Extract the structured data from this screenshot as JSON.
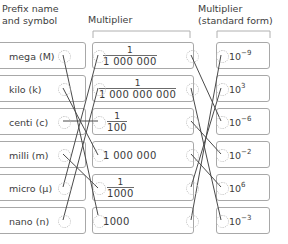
{
  "headers": {
    "prefix": "Prefix name\nand symbol",
    "multiplier": "Multiplier",
    "standard": "Multiplier\n(standard form)"
  },
  "columns": {
    "prefixes": [
      {
        "label": "mega (M)"
      },
      {
        "label": "kilo (k)"
      },
      {
        "label": "centi (c)"
      },
      {
        "label": "milli (m)"
      },
      {
        "label": "micro (µ)"
      },
      {
        "label": "nano (n)"
      }
    ],
    "multipliers": [
      {
        "numerator": "1",
        "denominator": "1 000 000",
        "whole": ""
      },
      {
        "numerator": "1",
        "denominator": "1 000 000 000",
        "whole": ""
      },
      {
        "numerator": "1",
        "denominator": "100",
        "whole": ""
      },
      {
        "numerator": "",
        "denominator": "",
        "whole": "1 000 000"
      },
      {
        "numerator": "1",
        "denominator": "1000",
        "whole": ""
      },
      {
        "numerator": "",
        "denominator": "",
        "whole": "1000"
      }
    ],
    "standard_forms": [
      {
        "base": "10",
        "exponent": "−9"
      },
      {
        "base": "10",
        "exponent": "3"
      },
      {
        "base": "10",
        "exponent": "−6"
      },
      {
        "base": "10",
        "exponent": "−2"
      },
      {
        "base": "10",
        "exponent": "6"
      },
      {
        "base": "10",
        "exponent": "−3"
      }
    ]
  },
  "colors": {
    "box_border": "#a8a8a8",
    "line": "#4a4a4a",
    "node": "#b9b9b9",
    "text": "#3d3d3d"
  }
}
